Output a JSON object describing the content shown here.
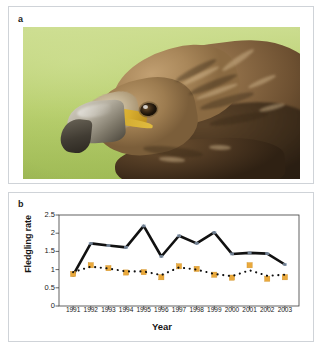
{
  "figure": {
    "panel_a_label": "a",
    "panel_b_label": "b"
  },
  "photo": {
    "subject": "golden-eagle-head",
    "alt": "Close-up photograph of a golden eagle head in profile against a green background",
    "background_color": "#b9d070",
    "plumage_color": "#8d6c46",
    "beak_color": "#4a453b",
    "cere_color": "#d8ad2e"
  },
  "chart_data": {
    "type": "line",
    "title": "",
    "xlabel": "Year",
    "ylabel": "Fledgling rate",
    "categories": [
      "1991",
      "1992",
      "1993",
      "1994",
      "1995",
      "1996",
      "1997",
      "1998",
      "1999",
      "2000",
      "2001",
      "2002",
      "2003"
    ],
    "x": [
      1991,
      1992,
      1993,
      1994,
      1995,
      1996,
      1997,
      1998,
      1999,
      2000,
      2001,
      2002,
      2003
    ],
    "ylim": [
      0,
      2.5
    ],
    "yticks": [
      "0",
      "0.5",
      "1",
      "1.5",
      "2",
      "2.5"
    ],
    "ytick_values": [
      0,
      0.5,
      1,
      1.5,
      2,
      2.5
    ],
    "grid": false,
    "legend": "none",
    "series": [
      {
        "name": "black-solid-line",
        "style": "solid-line",
        "color": "#111111",
        "marker": "none",
        "values": [
          0.85,
          1.72,
          1.66,
          1.61,
          2.2,
          1.36,
          1.93,
          1.72,
          2.02,
          1.43,
          1.46,
          1.44,
          1.14
        ]
      },
      {
        "name": "black-dotted-line",
        "style": "dotted-line",
        "color": "#111111",
        "marker": "square-small",
        "values": [
          0.93,
          1.08,
          1.03,
          0.95,
          0.95,
          0.85,
          1.06,
          1.0,
          0.88,
          0.82,
          0.98,
          0.83,
          0.86
        ]
      },
      {
        "name": "orange-squares",
        "style": "markers-only",
        "color": "#eaa93c",
        "marker": "square",
        "values": [
          0.88,
          1.12,
          1.04,
          0.92,
          0.93,
          0.79,
          1.09,
          1.02,
          0.86,
          0.78,
          1.12,
          0.75,
          0.79
        ]
      }
    ]
  }
}
